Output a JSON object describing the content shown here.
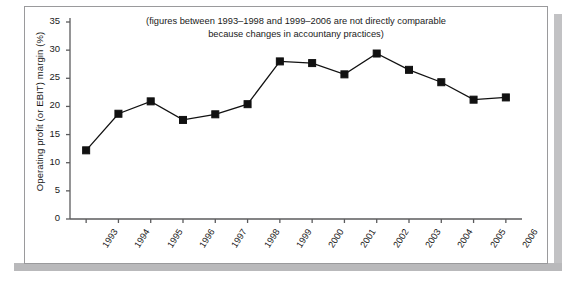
{
  "chart_data": {
    "type": "line",
    "title": "",
    "annotation": {
      "line1": "(figures between 1993–1998 and 1999–2006 are not directly comparable",
      "line2": "because changes in accountany practices)"
    },
    "xlabel": "",
    "ylabel": "Operating profit (or EBIT) margin (%)",
    "categories": [
      "1993",
      "1994",
      "1995",
      "1996",
      "1997",
      "1998",
      "1999",
      "2000",
      "2001",
      "2002",
      "2003",
      "2004",
      "2005",
      "2006"
    ],
    "values": [
      12.2,
      18.7,
      20.9,
      17.6,
      18.6,
      20.4,
      28.0,
      27.7,
      25.7,
      29.4,
      26.5,
      24.3,
      21.2,
      21.6
    ],
    "ylim": [
      0,
      35
    ],
    "yticks": [
      "0",
      "5",
      "10",
      "15",
      "20",
      "25",
      "30",
      "35"
    ],
    "grid": false,
    "legend": "none",
    "marker": "square",
    "series_color": "#111111",
    "line_color": "#111111"
  }
}
